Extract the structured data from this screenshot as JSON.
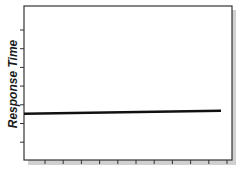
{
  "chart_data": {
    "type": "line",
    "title": "",
    "xlabel": "",
    "ylabel": "Response Time",
    "x_ticks": 11,
    "y_ticks": 7,
    "tick_labels_shown": false,
    "grid": false,
    "legend": null,
    "series": [
      {
        "name": "Response Time",
        "x": [
          0,
          1
        ],
        "y": [
          0.3,
          0.32
        ],
        "description": "nearly flat horizontal line, constant response time"
      }
    ],
    "xlim": [
      0,
      1
    ],
    "ylim": [
      0,
      1
    ],
    "colors": {
      "line": "#111111",
      "axis": "#333333",
      "shadow": "#c8c8c8"
    }
  }
}
